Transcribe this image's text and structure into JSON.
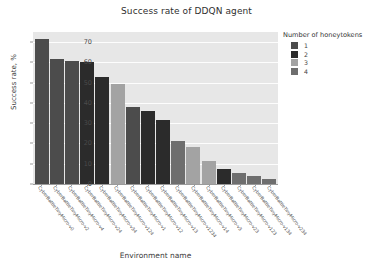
{
  "chart_data": {
    "type": "bar",
    "title": "Success rate of DDQN agent",
    "xlabel": "Environment name",
    "ylabel": "Success rate, %",
    "grid": true,
    "legend_position": "right",
    "ylim": [
      0,
      75
    ],
    "yticks": [
      0,
      10,
      20,
      30,
      40,
      50,
      60,
      70
    ],
    "legend": {
      "title": "Number of honeytokens",
      "entries": [
        {
          "label": "1",
          "color": "#4c4c4c"
        },
        {
          "label": "2",
          "color": "#2b2b2b"
        },
        {
          "label": "3",
          "color": "#a3a3a3"
        },
        {
          "label": "4",
          "color": "#6e6e6e"
        }
      ]
    },
    "categories": [
      "CyberBattleTinyMicro-v0",
      "CyberBattleTinyMicro-v2",
      "CyberBattleTinyMicro-v4",
      "CyberBattleTinyMicro-v24",
      "CyberBattleTinyMicro-v34",
      "CyberBattleTinyMicro-v124",
      "CyberBattleTinyMicro-v1",
      "CyberBattleTinyMicro-v12",
      "CyberBattleTinyMicro-v13",
      "CyberBattleTinyMicro-v1234",
      "CyberBattleTinyMicro-v14",
      "CyberBattleTinyMicro-v3",
      "CyberBattleTinyMicro-v23",
      "CyberBattleTinyMicro-v123",
      "CyberBattleTinyMicro-v134",
      "CyberBattleTinyMicro-v234"
    ],
    "values": [
      71.5,
      61.5,
      60.8,
      60.4,
      53.0,
      49.2,
      38.2,
      36.2,
      31.4,
      21.0,
      18.5,
      11.2,
      7.4,
      5.3,
      4.0,
      2.7
    ],
    "bar_colors": [
      "#4c4c4c",
      "#4c4c4c",
      "#4c4c4c",
      "#2b2b2b",
      "#2b2b2b",
      "#a3a3a3",
      "#4c4c4c",
      "#2b2b2b",
      "#2b2b2b",
      "#6e6e6e",
      "#a3a3a3",
      "#a3a3a3",
      "#2b2b2b",
      "#6e6e6e",
      "#6e6e6e",
      "#6e6e6e"
    ],
    "plot_background": "#e7e7e7",
    "grid_color": "#fdfdfd"
  }
}
